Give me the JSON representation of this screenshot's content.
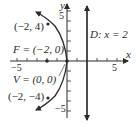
{
  "diagram": {
    "type": "parabola-graph",
    "axes": {
      "x_label": "x",
      "y_label": "y",
      "x_tick_labels": [
        "−5",
        "5"
      ],
      "y_tick_labels": [
        "5",
        "−5"
      ]
    },
    "labels": {
      "point_top": "(−2, 4)",
      "point_bottom": "(−2, −4)",
      "focus": "F = (−2, 0)",
      "vertex": "V = (0, 0)",
      "directrix": "D: x = 2"
    },
    "colors": {
      "line": "#2a2a2a",
      "background": "#ffffff"
    }
  }
}
